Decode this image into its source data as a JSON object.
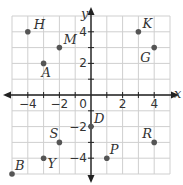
{
  "graph": {
    "x_axis_label": "x",
    "y_axis_label": "y",
    "origin_label": "0",
    "x_ticks": [
      {
        "value": -4,
        "label": "−4"
      },
      {
        "value": -2,
        "label": "−2"
      },
      {
        "value": 2,
        "label": "2"
      },
      {
        "value": 4,
        "label": "4"
      }
    ],
    "y_ticks": [
      {
        "value": 4,
        "label": "4"
      },
      {
        "value": 2,
        "label": "2"
      },
      {
        "value": -2,
        "label": "−2"
      },
      {
        "value": -4,
        "label": "−4"
      }
    ],
    "range": {
      "xmin": -5,
      "xmax": 5,
      "ymin": -5,
      "ymax": 5
    },
    "colors": {
      "grid": "#cfcfcf",
      "axis": "#222222",
      "point": "#555555"
    }
  },
  "points": [
    {
      "name": "H",
      "x": -4,
      "y": 4,
      "label_dx": 6,
      "label_dy": -3
    },
    {
      "name": "M",
      "x": -2,
      "y": 3,
      "label_dx": 4,
      "label_dy": -4
    },
    {
      "name": "A",
      "x": -3,
      "y": 2,
      "label_dx": -2,
      "label_dy": 14
    },
    {
      "name": "K",
      "x": 3,
      "y": 4,
      "label_dx": 4,
      "label_dy": -4
    },
    {
      "name": "G",
      "x": 4,
      "y": 3,
      "label_dx": -14,
      "label_dy": 14
    },
    {
      "name": "D",
      "x": 0,
      "y": -2,
      "label_dx": 3,
      "label_dy": -4
    },
    {
      "name": "S",
      "x": -2,
      "y": -3,
      "label_dx": -10,
      "label_dy": -4
    },
    {
      "name": "R",
      "x": 4,
      "y": -3,
      "label_dx": -12,
      "label_dy": -4
    },
    {
      "name": "Y",
      "x": -3,
      "y": -4,
      "label_dx": 4,
      "label_dy": 10
    },
    {
      "name": "P",
      "x": 1,
      "y": -4,
      "label_dx": 3,
      "label_dy": -4
    },
    {
      "name": "B",
      "x": -5,
      "y": -5,
      "label_dx": 3,
      "label_dy": -4
    }
  ]
}
